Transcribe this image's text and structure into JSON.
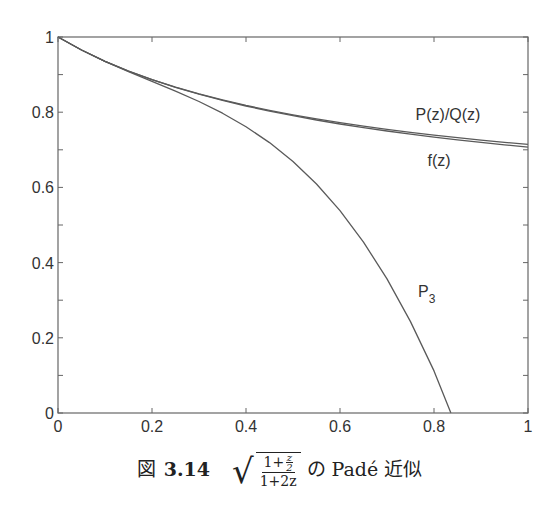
{
  "chart_data": {
    "type": "line",
    "title": "",
    "xlabel": "",
    "ylabel": "",
    "xlim": [
      0,
      1
    ],
    "ylim": [
      0,
      1
    ],
    "grid": false,
    "legend": "inline labels",
    "x_ticks": [
      0,
      0.2,
      0.4,
      0.6,
      0.8,
      1
    ],
    "x_tick_labels": [
      "0",
      "0.2",
      "0.4",
      "0.6",
      "0.8",
      "1"
    ],
    "y_ticks_minor": [
      0,
      0.1,
      0.2,
      0.3,
      0.4,
      0.5,
      0.6,
      0.7,
      0.8,
      0.9,
      1
    ],
    "y_tick_labels": [
      "0",
      "0.2",
      "0.4",
      "0.6",
      "0.8",
      "1"
    ],
    "x": [
      0,
      0.05,
      0.1,
      0.15,
      0.2,
      0.25,
      0.3,
      0.35,
      0.4,
      0.45,
      0.5,
      0.55,
      0.6,
      0.65,
      0.7,
      0.75,
      0.8,
      0.85,
      0.9,
      0.95,
      1
    ],
    "series": [
      {
        "name": "P(z)/Q(z)",
        "label_pos": [
          448,
          120
        ],
        "values": [
          1,
          0.9653,
          0.9355,
          0.9095,
          0.8868,
          0.8667,
          0.8487,
          0.8327,
          0.8182,
          0.8051,
          0.7931,
          0.7822,
          0.7722,
          0.7629,
          0.7544,
          0.7465,
          0.7391,
          0.7323,
          0.7259,
          0.7199,
          0.7143
        ]
      },
      {
        "name": "f(z)",
        "label_pos": [
          439,
          166
        ],
        "values": [
          1,
          0.9653,
          0.9354,
          0.9094,
          0.8864,
          0.866,
          0.8478,
          0.8314,
          0.8165,
          0.803,
          0.7906,
          0.7792,
          0.7687,
          0.759,
          0.75,
          0.7416,
          0.7338,
          0.7265,
          0.7196,
          0.7132,
          0.7071
        ]
      },
      {
        "name": "P3",
        "label_main": "P",
        "label_sub": "3",
        "label_pos": [
          418,
          297
        ],
        "x": [
          0,
          0.05,
          0.1,
          0.15,
          0.2,
          0.25,
          0.3,
          0.35,
          0.4,
          0.45,
          0.5,
          0.55,
          0.6,
          0.65,
          0.7,
          0.75,
          0.8,
          0.836
        ],
        "values": [
          1,
          0.9653,
          0.9351,
          0.9079,
          0.8821,
          0.8561,
          0.8284,
          0.7974,
          0.7615,
          0.7192,
          0.669,
          0.6091,
          0.5382,
          0.4546,
          0.3567,
          0.2431,
          0.112,
          0.0
        ]
      }
    ]
  },
  "caption": {
    "figure_word": "図",
    "figure_number": "3.14",
    "formula_num_lead": "1+",
    "formula_num_frac_top": "z",
    "formula_num_frac_bottom": "2",
    "formula_den": "1+2z",
    "radical": "√",
    "suffix": "の Padé 近似"
  }
}
